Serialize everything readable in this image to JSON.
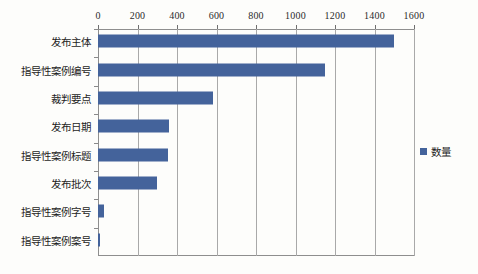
{
  "chart_data": {
    "type": "bar",
    "orientation": "horizontal",
    "title": "",
    "xlabel": "",
    "ylabel": "",
    "xlim": [
      0,
      1600
    ],
    "xticks": [
      0,
      200,
      400,
      600,
      800,
      1000,
      1200,
      1400,
      1600
    ],
    "xtick_labels": [
      "0",
      "200",
      "400",
      "600",
      "800",
      "1000",
      "1200",
      "1400",
      "1600"
    ],
    "grid": true,
    "grid_axis": "x",
    "legend": {
      "position": "right",
      "entries": [
        {
          "label": "数量",
          "color": "#44639b"
        }
      ]
    },
    "categories": [
      "发布主体",
      "指导性案例编号",
      "裁判要点",
      "发布日期",
      "指导性案例标题",
      "发布批次",
      "指导性案例字号",
      "指导性案例案号"
    ],
    "series": [
      {
        "name": "数量",
        "color": "#44639b",
        "values": [
          1500,
          1150,
          580,
          360,
          355,
          300,
          30,
          5
        ]
      }
    ]
  },
  "colors": {
    "bar": "#44639b",
    "grid": "#a9a9a9",
    "axis": "#8e8e8e",
    "background": "#fdfdfb",
    "text": "#1d1d1d"
  }
}
